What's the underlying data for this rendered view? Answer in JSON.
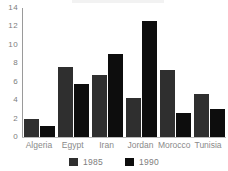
{
  "chart_data": {
    "type": "bar",
    "title": "",
    "xlabel": "",
    "ylabel": "",
    "categories": [
      "Algeria",
      "Egypt",
      "Iran",
      "Jordan",
      "Morocco",
      "Tunisia"
    ],
    "series": [
      {
        "name": "1985",
        "color": "#2f2f2f",
        "values": [
          2.0,
          7.6,
          6.7,
          4.2,
          7.3,
          4.7
        ]
      },
      {
        "name": "1990",
        "color": "#0d0d0d",
        "values": [
          1.2,
          5.7,
          9.0,
          12.6,
          2.6,
          3.0
        ]
      }
    ],
    "ylim": [
      0,
      14
    ],
    "yticks": [
      "0",
      "2",
      "4",
      "6",
      "8",
      "10",
      "12",
      "14"
    ],
    "ytick_values": [
      0,
      2,
      4,
      6,
      8,
      10,
      12,
      14
    ],
    "grid": false,
    "legend_position": "bottom",
    "legend": [
      "1985",
      "1990"
    ]
  }
}
